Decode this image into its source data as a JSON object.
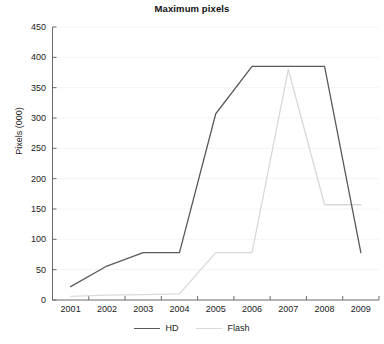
{
  "chart_data": {
    "type": "line",
    "title": "Maximum pixels",
    "xlabel": "",
    "ylabel": "Pixels (000)",
    "x": [
      "2001",
      "2002",
      "2003",
      "2004",
      "2005",
      "2006",
      "2007",
      "2008",
      "2009"
    ],
    "categories": [
      "2001",
      "2002",
      "2003",
      "2004",
      "2005",
      "2006",
      "2007",
      "2008",
      "2009"
    ],
    "series": [
      {
        "name": "HD",
        "color": "#5a5a5a",
        "values": [
          22,
          56,
          78,
          78,
          307,
          385,
          385,
          385,
          78
        ]
      },
      {
        "name": "Flash",
        "color": "#d9d9d9",
        "values": [
          6,
          8,
          9,
          10,
          78,
          78,
          380,
          157,
          157
        ]
      }
    ],
    "ylim": [
      0,
      450
    ],
    "ytick_step": 50,
    "yticks": [
      0,
      50,
      100,
      150,
      200,
      250,
      300,
      350,
      400,
      450
    ],
    "ytick_labels": [
      "0",
      "50",
      "100",
      "150",
      "200",
      "250",
      "300",
      "350",
      "400",
      "450"
    ],
    "grid": true,
    "grid_color": "#f4f4f6",
    "legend_position": "bottom",
    "axis_color": "#6a6a6a",
    "background": "#ffffff"
  },
  "legend": {
    "items": [
      {
        "label": "HD",
        "color": "#5a5a5a"
      },
      {
        "label": "Flash",
        "color": "#d9d9d9"
      }
    ]
  }
}
